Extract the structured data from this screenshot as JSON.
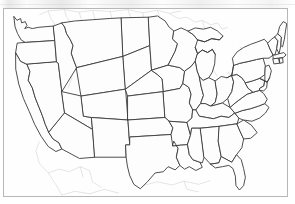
{
  "figure": {
    "map_type": "political-outline",
    "region": "Contiguous United States (Lower 48)",
    "has_labels": false,
    "has_legend": false,
    "has_scalebar": false,
    "has_compass": false,
    "frame_visible": true
  },
  "colors": {
    "background": "#ffffff",
    "map_fill": "#fefefe",
    "state_border": "#3a3a3a",
    "faint_line": "#c9c9c9",
    "frame_border": "#b7b7b7"
  },
  "layers": [
    {
      "name": "state-borders",
      "style": "solid dark outline",
      "color": "#3a3a3a"
    },
    {
      "name": "county-and-river-lines",
      "style": "faint gray hairlines",
      "color": "#c9c9c9"
    },
    {
      "name": "neighboring-country-outlines",
      "style": "faint gray hairlines",
      "color": "#cfcfcf"
    }
  ],
  "states": [
    {
      "code": "WA",
      "name": "Washington"
    },
    {
      "code": "OR",
      "name": "Oregon"
    },
    {
      "code": "CA",
      "name": "California"
    },
    {
      "code": "NV",
      "name": "Nevada"
    },
    {
      "code": "ID",
      "name": "Idaho"
    },
    {
      "code": "MT",
      "name": "Montana"
    },
    {
      "code": "WY",
      "name": "Wyoming"
    },
    {
      "code": "UT",
      "name": "Utah"
    },
    {
      "code": "AZ",
      "name": "Arizona"
    },
    {
      "code": "NM",
      "name": "New Mexico"
    },
    {
      "code": "CO",
      "name": "Colorado"
    },
    {
      "code": "ND",
      "name": "North Dakota"
    },
    {
      "code": "SD",
      "name": "South Dakota"
    },
    {
      "code": "NE",
      "name": "Nebraska"
    },
    {
      "code": "KS",
      "name": "Kansas"
    },
    {
      "code": "OK",
      "name": "Oklahoma"
    },
    {
      "code": "TX",
      "name": "Texas"
    },
    {
      "code": "MN",
      "name": "Minnesota"
    },
    {
      "code": "IA",
      "name": "Iowa"
    },
    {
      "code": "MO",
      "name": "Missouri"
    },
    {
      "code": "AR",
      "name": "Arkansas"
    },
    {
      "code": "LA",
      "name": "Louisiana"
    },
    {
      "code": "WI",
      "name": "Wisconsin"
    },
    {
      "code": "IL",
      "name": "Illinois"
    },
    {
      "code": "MI",
      "name": "Michigan"
    },
    {
      "code": "IN",
      "name": "Indiana"
    },
    {
      "code": "OH",
      "name": "Ohio"
    },
    {
      "code": "KY",
      "name": "Kentucky"
    },
    {
      "code": "TN",
      "name": "Tennessee"
    },
    {
      "code": "MS",
      "name": "Mississippi"
    },
    {
      "code": "AL",
      "name": "Alabama"
    },
    {
      "code": "GA",
      "name": "Georgia"
    },
    {
      "code": "FL",
      "name": "Florida"
    },
    {
      "code": "SC",
      "name": "South Carolina"
    },
    {
      "code": "NC",
      "name": "North Carolina"
    },
    {
      "code": "VA",
      "name": "Virginia"
    },
    {
      "code": "WV",
      "name": "West Virginia"
    },
    {
      "code": "MD",
      "name": "Maryland"
    },
    {
      "code": "DE",
      "name": "Delaware"
    },
    {
      "code": "PA",
      "name": "Pennsylvania"
    },
    {
      "code": "NJ",
      "name": "New Jersey"
    },
    {
      "code": "NY",
      "name": "New York"
    },
    {
      "code": "CT",
      "name": "Connecticut"
    },
    {
      "code": "RI",
      "name": "Rhode Island"
    },
    {
      "code": "MA",
      "name": "Massachusetts"
    },
    {
      "code": "VT",
      "name": "Vermont"
    },
    {
      "code": "NH",
      "name": "New Hampshire"
    },
    {
      "code": "ME",
      "name": "Maine"
    }
  ],
  "water_features": [
    "Lake Superior",
    "Lake Michigan",
    "Lake Huron",
    "Lake Erie",
    "Lake Ontario",
    "Chesapeake Bay",
    "Gulf of Mexico",
    "Pacific Ocean",
    "Atlantic Ocean"
  ],
  "adjacent_regions": [
    "Canada",
    "Mexico",
    "Baja California"
  ]
}
